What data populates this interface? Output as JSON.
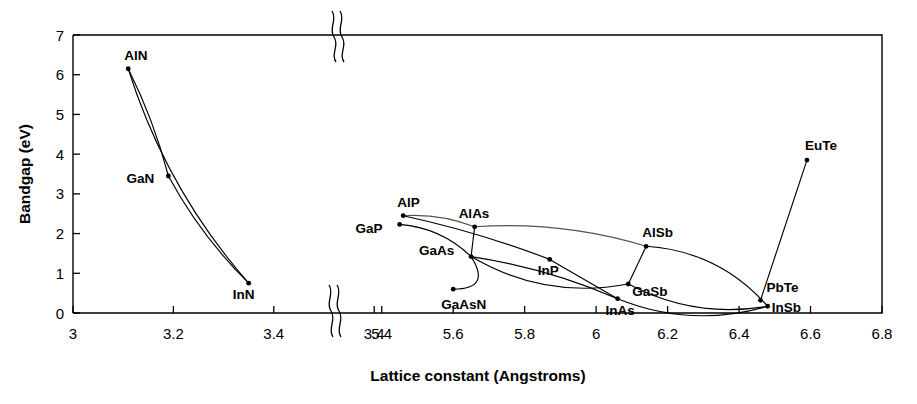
{
  "chart_data": {
    "type": "scatter",
    "title": "",
    "xlabel": "Lattice constant (Angstroms)",
    "ylabel": "Bandgap (eV)",
    "xlim": [
      3.0,
      6.8
    ],
    "ylim": [
      0,
      7
    ],
    "grid": false,
    "legend": "none",
    "axis_break": {
      "present": true,
      "between": [
        3.5,
        5.3
      ],
      "symbol": "double-squiggle"
    },
    "x_tick_labels": [
      "3",
      "3.2",
      "3.4",
      "3.4",
      "5.4",
      "5.6",
      "5.8",
      "6",
      "6.2",
      "6.4",
      "6.6",
      "6.8"
    ],
    "y_tick_labels": [
      "0",
      "1",
      "2",
      "3",
      "4",
      "5",
      "6",
      "7"
    ],
    "points": [
      {
        "name": "AlN",
        "x": 3.11,
        "y": 6.15,
        "label_dx": -4,
        "label_dy": -9
      },
      {
        "name": "GaN",
        "x": 3.19,
        "y": 3.45,
        "label_dx": -42,
        "label_dy": 7
      },
      {
        "name": "InN",
        "x": 3.35,
        "y": 0.75,
        "label_dx": -16,
        "label_dy": 16
      },
      {
        "name": "AlP",
        "x": 5.46,
        "y": 2.45,
        "label_dx": -6,
        "label_dy": -9
      },
      {
        "name": "GaP",
        "x": 5.45,
        "y": 2.23,
        "label_dx": -44,
        "label_dy": 9
      },
      {
        "name": "AlAs",
        "x": 5.66,
        "y": 2.17,
        "label_dx": -16,
        "label_dy": -9
      },
      {
        "name": "GaAs",
        "x": 5.65,
        "y": 1.42,
        "label_dx": -52,
        "label_dy": -2
      },
      {
        "name": "GaAsN",
        "x": 5.6,
        "y": 0.6,
        "label_dx": -12,
        "label_dy": 20
      },
      {
        "name": "InP",
        "x": 5.87,
        "y": 1.35,
        "label_dx": -12,
        "label_dy": 16
      },
      {
        "name": "InAs",
        "x": 6.06,
        "y": 0.36,
        "label_dx": -12,
        "label_dy": 16
      },
      {
        "name": "AlSb",
        "x": 6.14,
        "y": 1.68,
        "label_dx": -4,
        "label_dy": -9
      },
      {
        "name": "GaSb",
        "x": 6.09,
        "y": 0.73,
        "label_dx": 4,
        "label_dy": 12
      },
      {
        "name": "InSb",
        "x": 6.48,
        "y": 0.17,
        "label_dx": 4,
        "label_dy": 6
      },
      {
        "name": "PbTe",
        "x": 6.46,
        "y": 0.32,
        "label_dx": 6,
        "label_dy": -8
      },
      {
        "name": "EuTe",
        "x": 6.59,
        "y": 3.85,
        "label_dx": -2,
        "label_dy": -10
      }
    ],
    "connections": [
      {
        "from": "AlN",
        "to": "InN",
        "style": "solid"
      },
      {
        "from": "AlN",
        "to": "GaN",
        "style": "solid"
      },
      {
        "from": "GaN",
        "to": "InN",
        "style": "solid"
      },
      {
        "from": "AlP",
        "to": "AlAs",
        "style": "light"
      },
      {
        "from": "AlAs",
        "to": "AlSb",
        "style": "light"
      },
      {
        "from": "GaP",
        "to": "GaAs",
        "style": "solid"
      },
      {
        "from": "GaAs",
        "to": "GaSb",
        "style": "solid"
      },
      {
        "from": "GaAs",
        "to": "InAs",
        "style": "solid"
      },
      {
        "from": "AlAs",
        "to": "GaAs",
        "style": "solid"
      },
      {
        "from": "AlP",
        "to": "InP",
        "style": "solid"
      },
      {
        "from": "InP",
        "to": "InAs",
        "style": "solid"
      },
      {
        "from": "InAs",
        "to": "InSb",
        "style": "solid"
      },
      {
        "from": "AlSb",
        "to": "GaSb",
        "style": "solid"
      },
      {
        "from": "AlSb",
        "to": "InSb",
        "style": "solid"
      },
      {
        "from": "GaSb",
        "to": "InSb",
        "style": "solid"
      },
      {
        "from": "PbTe",
        "to": "EuTe",
        "style": "solid"
      },
      {
        "from": "GaAs",
        "to": "GaAsN",
        "style": "solid"
      }
    ]
  }
}
